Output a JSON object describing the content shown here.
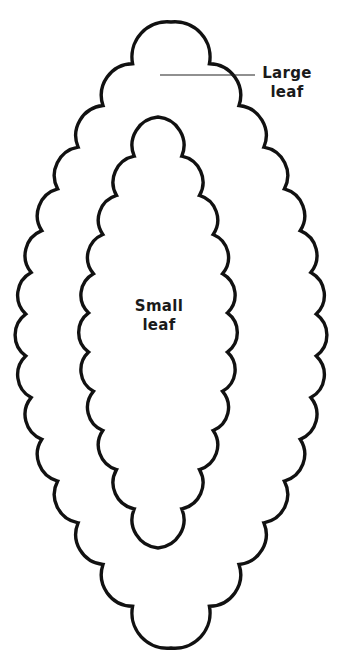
{
  "diagram": {
    "type": "labeled-illustration",
    "background": "#ffffff",
    "line_color": "#111111",
    "labels": {
      "large_leaf": {
        "line1": "Large",
        "line2": "leaf"
      },
      "small_leaf": {
        "line1": "Small",
        "line2": "leaf"
      }
    },
    "shapes": {
      "large_leaf": {
        "center_x": 171,
        "top_y": 22,
        "bottom_y": 648,
        "half_width": 146,
        "scallops_per_side": 15
      },
      "small_leaf": {
        "center_x": 158,
        "top_y": 117,
        "bottom_y": 548,
        "half_width": 70,
        "scallops_per_side": 11
      }
    },
    "leader_line": {
      "x1": 160,
      "y1": 75,
      "x2": 255,
      "y2": 75
    }
  }
}
